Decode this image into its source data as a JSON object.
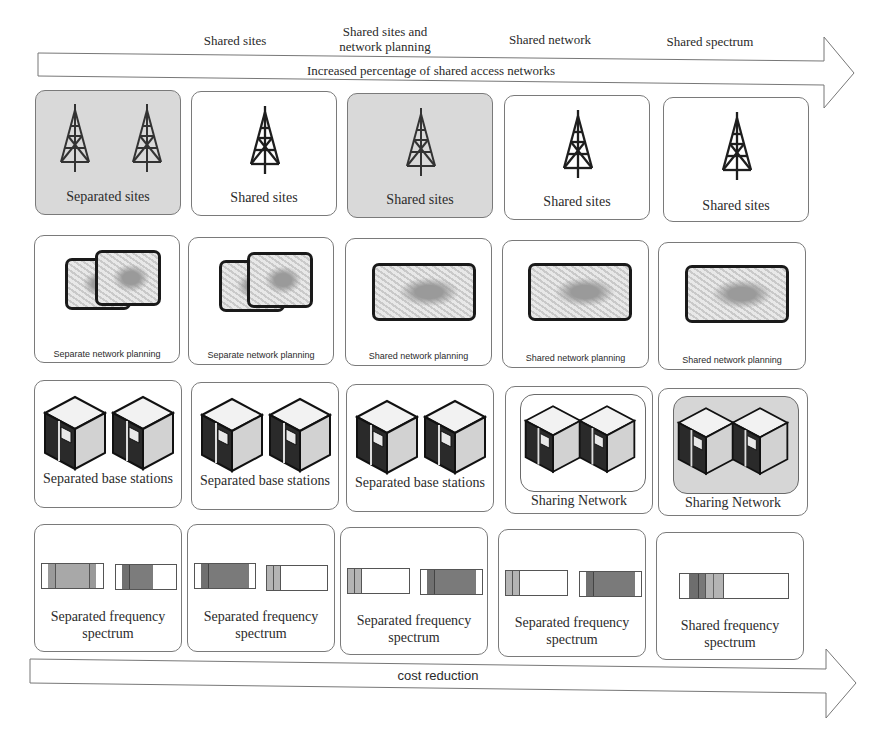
{
  "stages": [
    {
      "label": "Shared sites"
    },
    {
      "label": "Shared sites and network planning"
    },
    {
      "label": "Shared network"
    },
    {
      "label": "Shared spectrum"
    }
  ],
  "top_arrow": {
    "label": "Increased percentage of shared access networks"
  },
  "bottom_arrow": {
    "label": "cost reduction"
  },
  "rows": {
    "sites": [
      {
        "label": "Separated sites",
        "shaded": true,
        "towers": 2
      },
      {
        "label": "Shared sites",
        "shaded": false,
        "towers": 1
      },
      {
        "label": "Shared sites",
        "shaded": true,
        "towers": 1
      },
      {
        "label": "Shared sites",
        "shaded": false,
        "towers": 1
      },
      {
        "label": "Shared sites",
        "shaded": false,
        "towers": 1
      }
    ],
    "planning": [
      {
        "label": "Separate network planning",
        "maps": 2
      },
      {
        "label": "Separate network planning",
        "maps": 2
      },
      {
        "label": "Shared network planning",
        "maps": 1
      },
      {
        "label": "Shared network planning",
        "maps": 1
      },
      {
        "label": "Shared network planning",
        "maps": 1
      }
    ],
    "base_stations": [
      {
        "label": "Separated base stations",
        "grouped": false,
        "group_shaded": false
      },
      {
        "label": "Separated base stations",
        "grouped": false,
        "group_shaded": false
      },
      {
        "label": "Separated base stations",
        "grouped": false,
        "group_shaded": false
      },
      {
        "label": "Sharing Network",
        "grouped": true,
        "group_shaded": false
      },
      {
        "label": "Sharing Network",
        "grouped": true,
        "group_shaded": true
      }
    ],
    "spectrum": [
      {
        "label_line1": "Separated frequency",
        "label_line2": "spectrum"
      },
      {
        "label_line1": "Separated frequency",
        "label_line2": "spectrum"
      },
      {
        "label_line1": "Separated frequency",
        "label_line2": "spectrum"
      },
      {
        "label_line1": "Separated frequency",
        "label_line2": "spectrum"
      },
      {
        "label_line1": "Shared frequency",
        "label_line2": "spectrum"
      }
    ]
  },
  "colors": {
    "shaded_card": "#d9d9d9",
    "spectrum_light": "#b4b4b4",
    "spectrum_mid": "#9a9a9a",
    "spectrum_dark": "#707070",
    "outline": "#7a7a7a"
  }
}
